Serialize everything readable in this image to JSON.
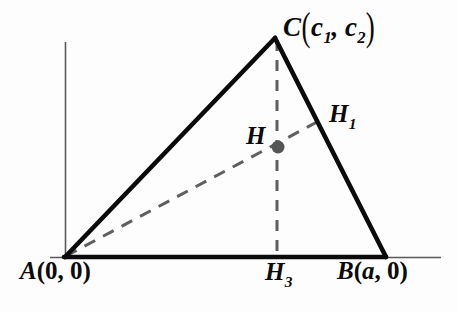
{
  "figure": {
    "type": "geometry-diagram",
    "background_color": "#fdfdfd",
    "stroke_color": "#0b0b0b",
    "dash_color": "#5f5f5f",
    "axis_color": "#5a5a5a",
    "point_color": "#555555",
    "axes": {
      "y_axis": {
        "x": 65,
        "y_top": 42,
        "y_bottom": 258
      },
      "x_axis": {
        "y": 257,
        "x_left": 50,
        "x_right": 441
      }
    },
    "vertices": {
      "A": {
        "x": 65,
        "y": 257,
        "label": "A",
        "coords": "(0, 0)"
      },
      "B": {
        "x": 385,
        "y": 257,
        "label": "B",
        "coords": "(a, 0)"
      },
      "C": {
        "x": 275,
        "y": 38,
        "label": "C",
        "coords": "(c1, c2)"
      }
    },
    "points": {
      "H": {
        "x": 278,
        "y": 147,
        "label": "H",
        "dot_radius": 6.5
      },
      "H1": {
        "x": 316,
        "y": 123,
        "label": "H",
        "subscript": "1"
      },
      "H3": {
        "x": 277,
        "y": 257,
        "label": "H",
        "subscript": "3"
      }
    },
    "segments": [
      {
        "name": "side-AC",
        "style": "solid",
        "from": "A",
        "to": "C"
      },
      {
        "name": "side-CB",
        "style": "solid",
        "from": "C",
        "to": "B"
      },
      {
        "name": "side-AB",
        "style": "solid",
        "from": "A",
        "to": "B"
      },
      {
        "name": "altitude-C-H3",
        "style": "dashed",
        "from": "C",
        "to": "H3"
      },
      {
        "name": "cevian-A-H1",
        "style": "dashed",
        "from": "A",
        "to": "H1"
      }
    ]
  },
  "labels": {
    "C_letter": "C",
    "C_open": "(",
    "C_c1_letter": "c",
    "C_c1_sub": "1",
    "C_comma": ",",
    "C_c2_letter": "c",
    "C_c2_sub": "2",
    "C_close": ")",
    "A_letter": "A",
    "A_coords": "(0, 0)",
    "B_letter": "B",
    "B_open": "(",
    "B_a": "a",
    "B_rest": ", 0)",
    "H_letter": "H",
    "H1_letter": "H",
    "H1_sub": "1",
    "H3_letter": "H",
    "H3_sub": "3"
  }
}
